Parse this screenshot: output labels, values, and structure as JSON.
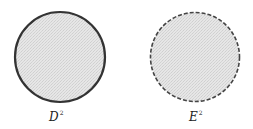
{
  "figure": {
    "left": {
      "name": "closed-disk",
      "label_base": "D",
      "label_sup": "2",
      "boundary": "solid",
      "fill": "#e4e4e4",
      "stroke": "#333333"
    },
    "right": {
      "name": "open-disk",
      "label_base": "E",
      "label_sup": "2",
      "boundary": "dashed",
      "fill": "#e4e4e4",
      "stroke": "#444444"
    }
  }
}
